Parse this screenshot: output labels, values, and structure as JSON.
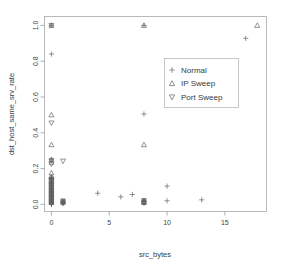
{
  "chart_data": {
    "type": "scatter",
    "title": "",
    "xlabel": "src_bytes",
    "ylabel": "dst_host_same_srv_rate",
    "xlim": [
      -0.6,
      18.6
    ],
    "ylim": [
      -0.04,
      1.05
    ],
    "grid": false,
    "legend_position": "center-right",
    "xticks": [
      "0",
      "5",
      "10",
      "15"
    ],
    "xtick_values": [
      0,
      5,
      10,
      15
    ],
    "yticks": [
      "0.0",
      "0.2",
      "0.4",
      "0.6",
      "0.8",
      "1.0"
    ],
    "ytick_values": [
      0.0,
      0.2,
      0.4,
      0.6,
      0.8,
      1.0
    ],
    "series": [
      {
        "name": "Normal",
        "marker": "plus",
        "color": "#6f6f6f",
        "points": [
          [
            0,
            1.0
          ],
          [
            0,
            0.84
          ],
          [
            0,
            0.25
          ],
          [
            0,
            0.145
          ],
          [
            0,
            0.125
          ],
          [
            0,
            0.115
          ],
          [
            0,
            0.105
          ],
          [
            0,
            0.095
          ],
          [
            0,
            0.088
          ],
          [
            0,
            0.08
          ],
          [
            0,
            0.072
          ],
          [
            0,
            0.065
          ],
          [
            0,
            0.058
          ],
          [
            0,
            0.05
          ],
          [
            0,
            0.043
          ],
          [
            0,
            0.036
          ],
          [
            0,
            0.03
          ],
          [
            0,
            0.024
          ],
          [
            0,
            0.018
          ],
          [
            0,
            0.012
          ],
          [
            0,
            0.006
          ],
          [
            0,
            0.0
          ],
          [
            1,
            0.012
          ],
          [
            1,
            0.004
          ],
          [
            4,
            0.062
          ],
          [
            6,
            0.042
          ],
          [
            7,
            0.055
          ],
          [
            8,
            0.018
          ],
          [
            8,
            0.505
          ],
          [
            10,
            0.102
          ],
          [
            10,
            0.02
          ],
          [
            13,
            0.025
          ],
          [
            16.8,
            0.928
          ],
          [
            8,
            1.0
          ]
        ]
      },
      {
        "name": "IP Sweep",
        "marker": "triangle-up",
        "color": "#6f6f6f",
        "points": [
          [
            0,
            1.0
          ],
          [
            0,
            0.5
          ],
          [
            0,
            0.333
          ],
          [
            0,
            0.25
          ],
          [
            0,
            0.235
          ],
          [
            0,
            0.175
          ],
          [
            0,
            0.155
          ],
          [
            8,
            0.333
          ],
          [
            8,
            1.0
          ],
          [
            8,
            0.012
          ],
          [
            17.8,
            1.0
          ]
        ]
      },
      {
        "name": "Port Sweep",
        "marker": "triangle-down",
        "color": "#6f6f6f",
        "points": [
          [
            0,
            1.0
          ],
          [
            0,
            0.455
          ],
          [
            0,
            0.245
          ],
          [
            0,
            0.225
          ],
          [
            1,
            0.242
          ],
          [
            1,
            0.008
          ],
          [
            8,
            0.008
          ]
        ]
      }
    ],
    "dense_cluster_note": "Heavy overplotting of Normal markers at src_bytes = 0 between rate 0.0 and 0.15"
  },
  "legend": {
    "entries": [
      {
        "label": "Normal",
        "marker": "plus"
      },
      {
        "label": "IP Sweep",
        "marker": "triangle-up"
      },
      {
        "label": "Port Sweep",
        "marker": "triangle-down"
      }
    ]
  },
  "axes": {
    "x_title": "src_bytes",
    "y_title": "dst_host_same_srv_rate"
  }
}
